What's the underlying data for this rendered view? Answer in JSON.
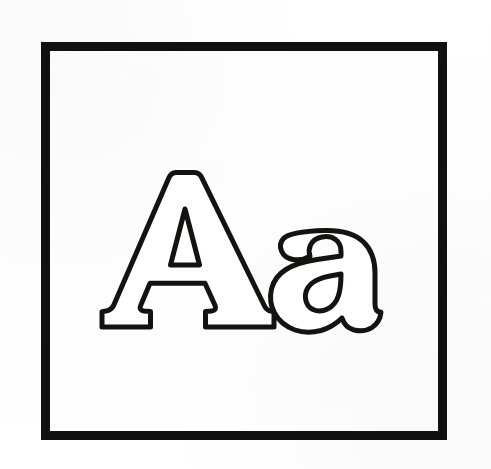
{
  "page": {
    "kind": "coloring-page-worksheet",
    "title": "Aa",
    "background_color": "#ffffff",
    "width": 491,
    "height": 469
  },
  "frame": {
    "name": "outer-border",
    "stroke_color": "#111111",
    "fill_color": "#ffffff",
    "stroke_width": 9,
    "x": 41,
    "y": 42,
    "width": 406,
    "height": 398
  },
  "letters": [
    {
      "id": "uppercase-a",
      "character": "A",
      "label": "Uppercase A",
      "case": "uppercase",
      "outline_color": "#15130f",
      "fill_color": "#ffffff",
      "stroke_width": 5,
      "has_counter": true,
      "counter_shape": "triangle",
      "bbox": {
        "x": 101,
        "y": 170,
        "width": 173,
        "height": 159
      }
    },
    {
      "id": "lowercase-a",
      "character": "a",
      "label": "Lowercase a",
      "case": "lowercase",
      "outline_color": "#15130f",
      "fill_color": "#ffffff",
      "stroke_width": 5,
      "has_counter": true,
      "counter_shape": "oval",
      "bbox": {
        "x": 262,
        "y": 228,
        "width": 120,
        "height": 104
      }
    }
  ],
  "colors": {
    "ink": "#15130f",
    "frame": "#111111",
    "paper": "#ffffff"
  }
}
